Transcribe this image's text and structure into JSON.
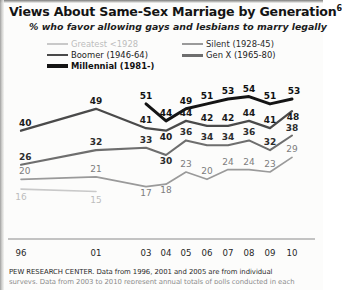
{
  "header": {
    "title": "Views About Same-Sex Marriage by Generation",
    "title_superscript": "6",
    "subtitle": "% who favor allowing gays and lesbians to marry legally"
  },
  "legend": {
    "items": [
      {
        "label": "Greatest <1928",
        "key": "greatest",
        "color": "#c9c9c9"
      },
      {
        "label": "Silent (1928-45)",
        "key": "silent",
        "color": "#9a9a9a"
      },
      {
        "label": "Boomer (1946-64)",
        "key": "boomer",
        "color": "#4a4a4a"
      },
      {
        "label": "Gen X (1965-80)",
        "key": "genx",
        "color": "#6e6e6e"
      },
      {
        "label": "Millennial (1981-)",
        "key": "millennial",
        "color": "#141414"
      }
    ]
  },
  "axis": {
    "tick_labels": [
      "96",
      "01",
      "03",
      "04",
      "05",
      "06",
      "07",
      "08",
      "09",
      "10"
    ]
  },
  "footnote": {
    "line1": "PEW RESEARCH CENTER. Data from 1996, 2001 and 2005 are from individual",
    "line2": "surveys. Data from 2003 to 2010 represent annual totals of polls conducted in each"
  },
  "chart_data": {
    "type": "line",
    "title": "Views About Same-Sex Marriage by Generation",
    "subtitle": "% who favor allowing gays and lesbians to marry legally",
    "xlabel": "",
    "ylabel": "",
    "x": [
      "96",
      "01",
      "03",
      "04",
      "05",
      "06",
      "07",
      "08",
      "09",
      "10"
    ],
    "ylim": [
      0,
      60
    ],
    "grid": false,
    "legend_position": "top",
    "series": [
      {
        "name": "Millennial (1981-)",
        "color": "#141414",
        "values": [
          null,
          null,
          51,
          44,
          49,
          51,
          53,
          54,
          51,
          53
        ]
      },
      {
        "name": "Boomer (1946-64)",
        "color": "#4a4a4a",
        "values": [
          40,
          49,
          41,
          40,
          44,
          42,
          42,
          44,
          41,
          48
        ]
      },
      {
        "name": "Gen X (1965-80)",
        "color": "#6e6e6e",
        "values": [
          26,
          32,
          33,
          30,
          36,
          34,
          34,
          36,
          32,
          38
        ]
      },
      {
        "name": "Silent (1928-45)",
        "color": "#9a9a9a",
        "values": [
          20,
          21,
          17,
          18,
          23,
          20,
          24,
          24,
          23,
          29
        ]
      },
      {
        "name": "Greatest <1928",
        "color": "#c9c9c9",
        "values": [
          16,
          15,
          null,
          null,
          null,
          null,
          null,
          null,
          null,
          null
        ]
      }
    ]
  }
}
